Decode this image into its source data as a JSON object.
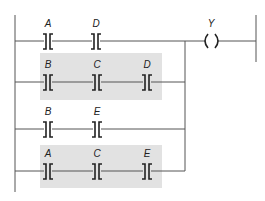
{
  "diagram": {
    "type": "ladder-logic",
    "output_coil": {
      "label": "Y"
    },
    "shade_color": "#e2e2e2",
    "line_color": "#555555",
    "rungs": [
      {
        "contacts": [
          "A",
          "D"
        ],
        "shaded": false
      },
      {
        "contacts": [
          "B",
          "C",
          "D"
        ],
        "shaded": true
      },
      {
        "contacts": [
          "B",
          "E"
        ],
        "shaded": false
      },
      {
        "contacts": [
          "A",
          "C",
          "E"
        ],
        "shaded": true
      }
    ]
  }
}
